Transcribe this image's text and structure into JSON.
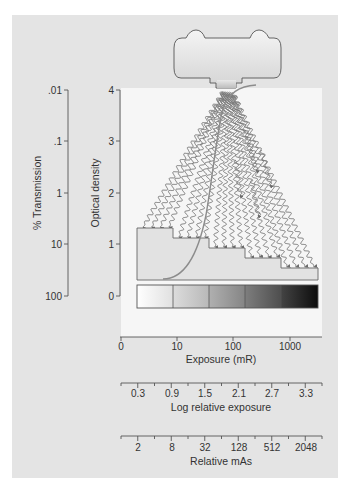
{
  "figure": {
    "axes": {
      "transmission": {
        "label": "% Transmission",
        "ticks": [
          ".01",
          ".1",
          "1",
          "10",
          "100"
        ]
      },
      "optical_density": {
        "label": "Optical density",
        "ticks": [
          "4",
          "3",
          "2",
          "1",
          "0"
        ]
      },
      "exposure": {
        "label": "Exposure (mR)",
        "ticks": [
          "0",
          "10",
          "100",
          "1000"
        ]
      },
      "log_relative_exposure": {
        "label": "Log relative exposure",
        "ticks": [
          "0.3",
          "0.9",
          "1.5",
          "2.1",
          "2.7",
          "3.3"
        ]
      },
      "relative_mas": {
        "label": "Relative mAs",
        "ticks": [
          "2",
          "8",
          "32",
          "128",
          "512",
          "2048"
        ]
      }
    },
    "components": {
      "tube": "x-ray-tube",
      "rays": "x-ray-beams",
      "wedge": "aluminum-step-wedge",
      "strip": "processed-film-density-strip",
      "curve": "characteristic-curve"
    },
    "colors": {
      "panel": "#e4e4e4",
      "plot_area": "#f5f5f5",
      "rays": "#777777",
      "curve": "#8a8a8a",
      "axis": "#555555"
    }
  },
  "chart_data": {
    "type": "line",
    "xlabel": "Exposure (mR)",
    "ylabel": "Optical density",
    "secondary_ylabel": "% Transmission",
    "secondary_xlabels": [
      "Log relative exposure",
      "Relative mAs"
    ],
    "x_ticks": [
      "0",
      "10",
      "100",
      "1000"
    ],
    "y_ticks": [
      0,
      1,
      2,
      3,
      4
    ],
    "transmission_ticks": [
      "100",
      "10",
      "1",
      ".1",
      ".01"
    ],
    "log_relative_exposure_ticks": [
      0.3,
      0.9,
      1.5,
      2.1,
      2.7,
      3.3
    ],
    "relative_mas_ticks": [
      2,
      8,
      32,
      128,
      512,
      2048
    ],
    "ylim": [
      0,
      4
    ],
    "series": [
      {
        "name": "Characteristic curve",
        "points_log_rel_exposure_vs_od": [
          [
            0.9,
            0.2
          ],
          [
            1.2,
            0.3
          ],
          [
            1.5,
            0.6
          ],
          [
            1.8,
            1.2
          ],
          [
            2.0,
            2.0
          ],
          [
            2.15,
            2.8
          ],
          [
            2.3,
            3.4
          ],
          [
            2.6,
            3.8
          ],
          [
            3.0,
            4.0
          ]
        ]
      }
    ],
    "step_wedge": {
      "steps": 5,
      "strip_densities": [
        "lightest",
        "light",
        "medium",
        "dark",
        "darkest"
      ]
    },
    "grid": false,
    "legend": "none"
  }
}
